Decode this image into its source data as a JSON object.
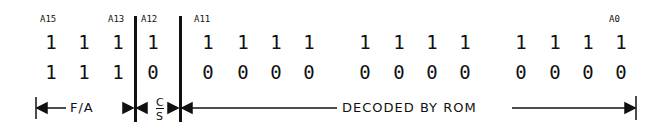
{
  "labels": {
    "a15": "A15",
    "a13": "A13",
    "a12": "A12",
    "a11": "A11",
    "a0": "A0"
  },
  "rows": [
    [
      "1",
      "1",
      "1",
      "1",
      "1",
      "1",
      "1",
      "1",
      "1",
      "1",
      "1",
      "1",
      "1",
      "1",
      "1",
      "1"
    ],
    [
      "1",
      "1",
      "1",
      "0",
      "0",
      "0",
      "0",
      "0",
      "0",
      "0",
      "0",
      "0",
      "0",
      "0",
      "0",
      "0"
    ]
  ],
  "fields": {
    "fa": "F/A",
    "cs_top": "C",
    "cs_bottom": "S",
    "rom": "DECODED BY ROM"
  }
}
